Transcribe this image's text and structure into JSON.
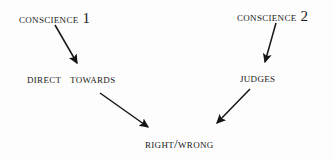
{
  "diagram": {
    "background_color": "#fdfdfd",
    "ink_color": "#1a1a1a",
    "nodes": [
      {
        "id": "conscience-1",
        "text": "CONSCIENCE",
        "numeral": "1"
      },
      {
        "id": "conscience-2",
        "text": "CONSCIENCE",
        "numeral": "2"
      },
      {
        "id": "direct-towards",
        "word1": "DIRECT",
        "word2": "TOWARDS"
      },
      {
        "id": "judges",
        "text": "JUDGES"
      },
      {
        "id": "right-wrong",
        "text": "RIGHT/WRONG"
      }
    ],
    "arrows": [
      {
        "id": "arrow-conscience1-to-direct",
        "from": "conscience-1",
        "to": "direct-towards",
        "direction": "down-right"
      },
      {
        "id": "arrow-conscience2-to-judges",
        "from": "conscience-2",
        "to": "judges",
        "direction": "down-left"
      },
      {
        "id": "arrow-direct-to-rightwrong",
        "from": "direct-towards",
        "to": "right-wrong",
        "direction": "down-right"
      },
      {
        "id": "arrow-judges-to-rightwrong",
        "from": "judges",
        "to": "right-wrong",
        "direction": "down-left"
      }
    ]
  }
}
